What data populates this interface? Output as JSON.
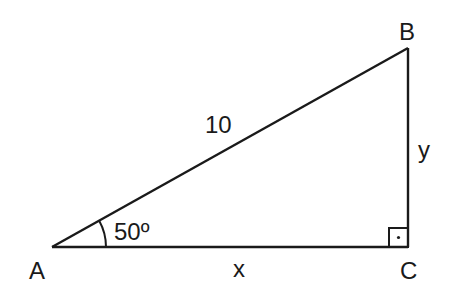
{
  "diagram": {
    "type": "right-triangle",
    "vertices": {
      "A": {
        "label": "A"
      },
      "B": {
        "label": "B"
      },
      "C": {
        "label": "C"
      }
    },
    "sides": {
      "hypotenuse_AB": {
        "label": "10"
      },
      "adjacent_AC": {
        "label": "x"
      },
      "opposite_BC": {
        "label": "y"
      }
    },
    "angle_A": {
      "label": "50º"
    },
    "right_angle_at": "C",
    "stroke_color": "#1a1a1a",
    "background": "#ffffff"
  }
}
